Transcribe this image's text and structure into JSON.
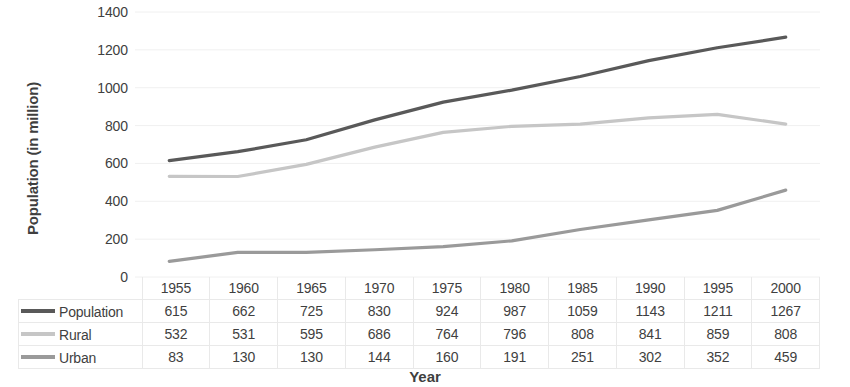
{
  "chart_data": {
    "type": "line",
    "title": "",
    "xlabel": "Year",
    "ylabel": "Population (in million)",
    "categories": [
      "1955",
      "1960",
      "1965",
      "1970",
      "1975",
      "1980",
      "1985",
      "1990",
      "1995",
      "2000"
    ],
    "series": [
      {
        "name": "Population",
        "color": "#595959",
        "values": [
          615,
          662,
          725,
          830,
          924,
          987,
          1059,
          1143,
          1211,
          1267
        ]
      },
      {
        "name": "Rural",
        "color": "#c6c6c6",
        "values": [
          532,
          531,
          595,
          686,
          764,
          796,
          808,
          841,
          859,
          808
        ]
      },
      {
        "name": "Urban",
        "color": "#9a9a9a",
        "values": [
          83,
          130,
          130,
          144,
          160,
          191,
          251,
          302,
          352,
          459
        ]
      }
    ],
    "ylim": [
      0,
      1400
    ],
    "y_ticks": [
      "0",
      "200",
      "400",
      "600",
      "800",
      "1000",
      "1200",
      "1400"
    ],
    "grid": true,
    "grid_color": "#f0f0f0",
    "legend_position": "table-row-header",
    "data_table_visible": true
  }
}
